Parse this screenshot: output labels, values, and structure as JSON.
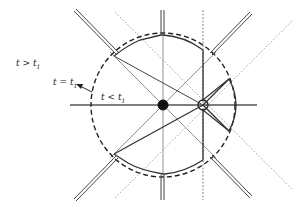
{
  "labels": {
    "t_gt": {
      "text": "t > t",
      "sub": "1"
    },
    "t_eq": {
      "text": "t = t",
      "sub": "1"
    },
    "t_lt": {
      "text": "t < t",
      "sub": "1"
    }
  },
  "colors": {
    "line": "#444444",
    "thin": "#666666",
    "background": "#ffffff"
  },
  "markers": {
    "origin": "filled-circle",
    "shifted": "open-circle"
  }
}
